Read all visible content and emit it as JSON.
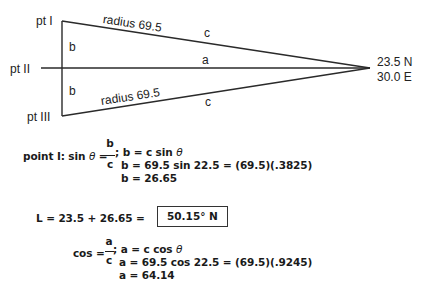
{
  "diagram": {
    "points": {
      "pt1": "pt I",
      "pt2": "pt II",
      "pt3": "pt III"
    },
    "side_labels": {
      "b_upper": "b",
      "b_lower": "b",
      "a": "a",
      "c_upper": "c",
      "c_lower": "c",
      "radius_upper": "radius 69.5",
      "radius_lower": "radius 69.5"
    },
    "apex": {
      "lat": "23.5 N",
      "lon": "30.0 E"
    }
  },
  "calc_b": {
    "prefix": "point I: sin",
    "theta": "θ",
    "equals": "=",
    "frac_num": "b",
    "frac_den": "c",
    "rest1": "; b = c sin",
    "line2": "b = 69.5 sin 22.5 = (69.5)(.3825)",
    "line3": "b = 26.65"
  },
  "calc_L": {
    "expr": "L = 23.5 + 26.65 =",
    "result": "50.15° N"
  },
  "calc_a": {
    "prefix": "cos =",
    "frac_num": "a",
    "frac_den": "c",
    "rest1": "; a = c cos",
    "theta": "θ",
    "line2": "a = 69.5 cos 22.5 = (69.5)(.9245)",
    "line3": "a = 64.14"
  }
}
